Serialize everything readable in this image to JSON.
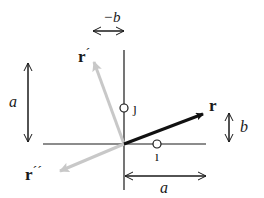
{
  "diagram": {
    "type": "vector rotation diagram",
    "colors": {
      "axis": "#1a1a1a",
      "vector_r": "#111111",
      "vector_rotated": "#c8c8c8",
      "dimension_arrow": "#1a1a1a"
    },
    "vectors": {
      "r": {
        "label": "r",
        "prime": ""
      },
      "r_prime": {
        "label": "r",
        "prime": "´"
      },
      "r_double_prime": {
        "label": "r",
        "prime": "´´"
      }
    },
    "unit_markers": {
      "i": "ı",
      "j": "ȷ"
    },
    "dimensions": {
      "left_vertical": "a",
      "bottom_horizontal": "a",
      "right_vertical": "b",
      "top_horizontal": "−b"
    }
  }
}
